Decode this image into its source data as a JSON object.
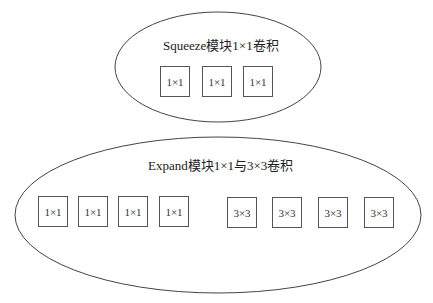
{
  "squeeze": {
    "title": "Squeeze模块1×1卷积",
    "boxes": [
      "1×1",
      "1×1",
      "1×1"
    ]
  },
  "expand": {
    "title": "Expand模块1×1与3×3卷积",
    "boxes": [
      "1×1",
      "1×1",
      "1×1",
      "1×1",
      "3×3",
      "3×3",
      "3×3",
      "3×3"
    ]
  }
}
